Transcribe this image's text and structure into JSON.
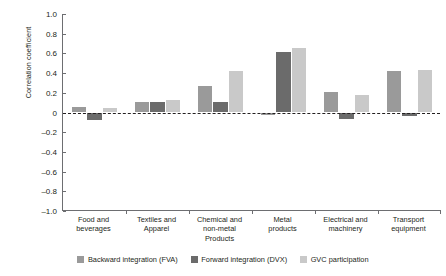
{
  "chart_data": {
    "type": "bar",
    "title": "",
    "subtitle": "",
    "xlabel": "",
    "ylabel": "Correlation coefficient",
    "ylim": [
      -1.0,
      1.0
    ],
    "ytick_labels": [
      "1.0",
      "0.8",
      "0.6",
      "0.4",
      "0.2",
      "0",
      "-0.2",
      "-0.4",
      "-0.6",
      "-0.8",
      "-1.0"
    ],
    "ytick_values": [
      1.0,
      0.8,
      0.6,
      0.4,
      0.2,
      0,
      -0.2,
      -0.4,
      -0.6,
      -0.8,
      -1.0
    ],
    "grid": false,
    "zero_reference_line": true,
    "legend_position": "bottom",
    "categories": [
      "Food and beverages",
      "Textiles and Apparel",
      "Chemical and non-metal Products",
      "Metal products",
      "Electrical and machinery",
      "Transport equipment"
    ],
    "category_lines": [
      [
        "Food and",
        "beverages"
      ],
      [
        "Textiles and",
        "Apparel"
      ],
      [
        "Chemical and",
        "non-metal",
        "Products"
      ],
      [
        "Metal",
        "products"
      ],
      [
        "Electrical and",
        "machinery"
      ],
      [
        "Transport",
        "equipment"
      ]
    ],
    "series": [
      {
        "name": "Backward integration (FVA)",
        "color": "#9a9a9a",
        "values": [
          0.06,
          0.11,
          0.27,
          -0.03,
          0.21,
          0.42
        ]
      },
      {
        "name": "Forward integration (DVX)",
        "color": "#6b6b6b",
        "values": [
          -0.08,
          0.11,
          0.11,
          0.61,
          -0.07,
          -0.04
        ]
      },
      {
        "name": "GVC participation",
        "color": "#c9c9c9",
        "values": [
          0.05,
          0.13,
          0.42,
          0.65,
          0.18,
          0.43
        ]
      }
    ]
  },
  "legend": {
    "items": [
      "Backward integration (FVA)",
      "Forward integration (DVX)",
      "GVC participation"
    ]
  },
  "colors": {
    "backward": "#9a9a9a",
    "forward": "#6b6b6b",
    "gvc": "#c9c9c9",
    "axis": "#6d6e71",
    "text": "#231f20",
    "background": "#ffffff"
  }
}
